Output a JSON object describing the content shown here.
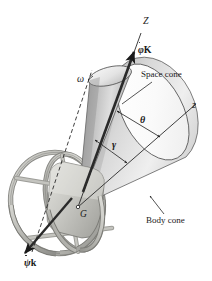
{
  "figure": {
    "background_color": "#ffffff",
    "line_color": "#1a1a1a",
    "surface_light": "#f2f2f2",
    "surface_mid": "#c9c9c9",
    "surface_dark": "#9a9a9a",
    "gimbal_color": "#b5b5b0"
  },
  "labels": {
    "axis_Z": "Z",
    "axis_z": "z",
    "vector_phiK_symbol": "φ",
    "vector_phiK_unit": "K",
    "vector_psik_symbol": "ψ",
    "vector_psik_unit": "k",
    "omega": "ω",
    "theta": "θ",
    "gamma": "γ",
    "space_cone": "Space cone",
    "body_cone": "Body cone",
    "mass_center": "G"
  },
  "geometry": {
    "mass_center_point": {
      "x": 78,
      "y": 207
    },
    "space_cone_top_ellipse": {
      "cx": 110,
      "cy": 77,
      "rx": 22,
      "ry": 9
    },
    "body_cone_base_ellipse": {
      "cx": 152,
      "cy": 143,
      "rx": 38,
      "ry": 52
    },
    "outer_gimbal_ring": {
      "cx": 58,
      "cy": 203,
      "rx": 47,
      "ry": 52
    },
    "inner_gimbal_ring": {
      "cx": 72,
      "cy": 203,
      "rx": 42,
      "ry": 48
    },
    "Z_axis_angle_deg": 22,
    "z_axis_angle_deg": 63
  }
}
